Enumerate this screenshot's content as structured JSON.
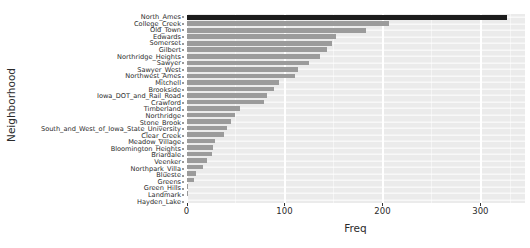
{
  "chart_data": {
    "type": "bar",
    "orientation": "horizontal",
    "title": "",
    "xlabel": "Freq",
    "ylabel": "Neighborhood",
    "xlim": [
      0,
      345
    ],
    "ylim": null,
    "grid": true,
    "legend": null,
    "xticks": [
      0,
      100,
      200,
      300
    ],
    "xticklabels": [
      "0",
      "100",
      "200",
      "300"
    ],
    "panel_background": "#ebebeb",
    "gridline_color": "#ffffff",
    "bar_color": "#9b9b9b",
    "highlight_bar_color": "#1c1c1c",
    "highlight_category": "North_Ames",
    "categories": [
      "North_Ames",
      "College_Creek",
      "Old_Town",
      "Edwards",
      "Somerset",
      "Gilbert",
      "Northridge_Heights",
      "Sawyer",
      "Sawyer_West",
      "Northwest_Ames",
      "Mitchell",
      "Brookside",
      "Iowa_DOT_and_Rail_Road",
      "Crawford",
      "Timberland",
      "Northridge",
      "Stone_Brook",
      "South_and_West_of_Iowa_State_University",
      "Clear_Creek",
      "Meadow_Village",
      "Bloomington_Heights",
      "Briardale",
      "Veenker",
      "Northpark_Villa",
      "Bluestе",
      "Greens",
      "Green_Hills",
      "Landmark",
      "Hayden_Lake"
    ],
    "values": [
      327,
      207,
      183,
      153,
      149,
      143,
      136,
      125,
      114,
      111,
      94,
      89,
      82,
      79,
      55,
      49,
      45,
      41,
      38,
      29,
      27,
      26,
      21,
      17,
      10,
      8,
      2,
      1,
      0
    ]
  },
  "axes": {
    "y_title": "Neighborhood",
    "x_title": "Freq"
  }
}
